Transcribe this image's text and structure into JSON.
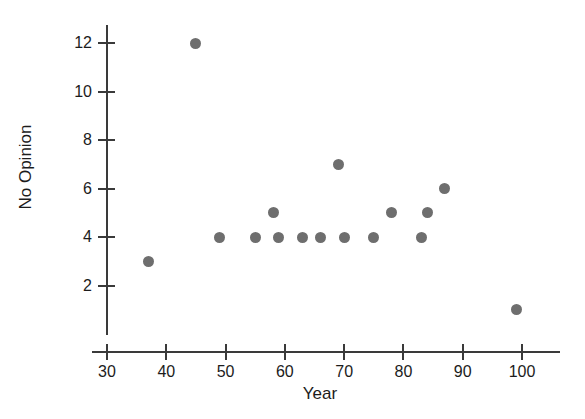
{
  "chart_data": {
    "type": "scatter",
    "title": "",
    "xlabel": "Year",
    "ylabel": "No Opinion",
    "xlim": [
      30,
      105
    ],
    "ylim": [
      0.5,
      13
    ],
    "grid": false,
    "legend": null,
    "xticks": [
      30,
      40,
      50,
      60,
      70,
      80,
      90,
      100
    ],
    "yticks": [
      2,
      4,
      6,
      8,
      10,
      12
    ],
    "marker_color": "#6e6e6e",
    "axis_color": "#3a3a3a",
    "points": [
      {
        "x": 37,
        "y": 3
      },
      {
        "x": 45,
        "y": 12
      },
      {
        "x": 49,
        "y": 4
      },
      {
        "x": 55,
        "y": 4
      },
      {
        "x": 58,
        "y": 5
      },
      {
        "x": 59,
        "y": 4
      },
      {
        "x": 63,
        "y": 4
      },
      {
        "x": 66,
        "y": 4
      },
      {
        "x": 69,
        "y": 7
      },
      {
        "x": 70,
        "y": 4
      },
      {
        "x": 75,
        "y": 4
      },
      {
        "x": 78,
        "y": 5
      },
      {
        "x": 83,
        "y": 4
      },
      {
        "x": 84,
        "y": 5
      },
      {
        "x": 87,
        "y": 6
      },
      {
        "x": 99,
        "y": 1
      }
    ]
  }
}
